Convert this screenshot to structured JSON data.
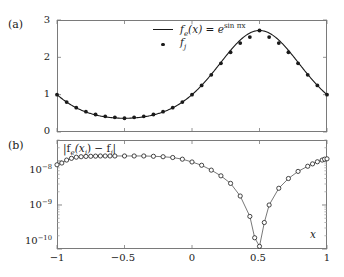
{
  "figure": {
    "panel_a_tag": "(a)",
    "panel_b_tag": "(b)",
    "x_axis_name": "x"
  },
  "legend": {
    "line_entry": {
      "prefix": "f",
      "sub": "e",
      "arg": "(x) = e",
      "exponent": "sin πx"
    },
    "dot_entry": {
      "prefix": "f",
      "sub": "j"
    }
  },
  "panel_b_title": {
    "open": "|f",
    "sub1": "e",
    "mid": "(x",
    "sub2": "j",
    "mid2": ") − f",
    "sub3": "j",
    "close": "|"
  },
  "axis": {
    "a_yticks": [
      "0",
      "1",
      "2",
      "3"
    ],
    "b_yticks": [
      "10",
      "10",
      "10"
    ],
    "b_yexps": [
      "−8",
      "−9",
      "−10"
    ],
    "xticks": [
      "−1",
      "−0.5",
      "0",
      "0.5",
      "1"
    ]
  },
  "chart_data": [
    {
      "type": "line",
      "panel": "(a)",
      "title": "",
      "xlabel": "x",
      "ylabel": "",
      "xlim": [
        -1,
        1
      ],
      "ylim": [
        0,
        3
      ],
      "yscale": "linear",
      "grid": false,
      "legend_position": "upper-center",
      "xticks": [
        -1,
        -0.5,
        0,
        0.5,
        1
      ],
      "yticks": [
        0,
        1,
        2,
        3
      ],
      "series": [
        {
          "name": "f_e(x) = e^{sin pi x}",
          "style": "solid-line",
          "color": "#1a1a1a",
          "x": [
            -1,
            -0.9286,
            -0.8571,
            -0.7857,
            -0.7143,
            -0.6429,
            -0.5714,
            -0.5,
            -0.4286,
            -0.3571,
            -0.2857,
            -0.2143,
            -0.1429,
            -0.0714,
            0,
            0.0714,
            0.1429,
            0.2143,
            0.2857,
            0.3571,
            0.4286,
            0.5,
            0.5714,
            0.6429,
            0.7143,
            0.7857,
            0.8571,
            0.9286,
            1
          ],
          "y": [
            1.0,
            0.8021,
            0.6527,
            0.5438,
            0.4683,
            0.4199,
            0.3936,
            0.3679,
            0.3936,
            0.4199,
            0.4683,
            0.5438,
            0.6527,
            0.8021,
            1.0,
            1.2467,
            1.5321,
            1.8389,
            2.1357,
            2.3811,
            2.5415,
            2.7183,
            2.5415,
            2.3811,
            2.1357,
            1.8389,
            1.5321,
            1.2467,
            1.0
          ]
        },
        {
          "name": "f_j",
          "style": "filled-dots",
          "color": "#1a1a1a",
          "x": [
            -1,
            -0.9286,
            -0.8571,
            -0.7857,
            -0.7143,
            -0.6429,
            -0.5714,
            -0.5,
            -0.4286,
            -0.3571,
            -0.2857,
            -0.2143,
            -0.1429,
            -0.0714,
            0,
            0.0714,
            0.1429,
            0.2143,
            0.2857,
            0.3571,
            0.4286,
            0.5,
            0.5714,
            0.6429,
            0.7143,
            0.7857,
            0.8571,
            0.9286,
            1
          ],
          "y": [
            1.0,
            0.8021,
            0.6527,
            0.5438,
            0.4683,
            0.4199,
            0.3936,
            0.3679,
            0.3936,
            0.4199,
            0.4683,
            0.5438,
            0.6527,
            0.8021,
            1.0,
            1.2467,
            1.5321,
            1.8389,
            2.1357,
            2.3811,
            2.5415,
            2.7183,
            2.5415,
            2.3811,
            2.1357,
            1.8389,
            1.5321,
            1.2467,
            1.0
          ]
        }
      ]
    },
    {
      "type": "line",
      "panel": "(b)",
      "title": "|f_e(x_j) - f_j|",
      "xlabel": "x",
      "ylabel": "",
      "xlim": [
        -1,
        1
      ],
      "ylim": [
        1e-10,
        3e-08
      ],
      "yscale": "log",
      "grid": false,
      "legend_position": "none",
      "xticks": [
        -1,
        -0.5,
        0,
        0.5,
        1
      ],
      "yticks": [
        1e-10,
        1e-09,
        1e-08
      ],
      "series": [
        {
          "name": "absolute error",
          "style": "open-circles-line",
          "color": "#1a1a1a",
          "x": [
            -1,
            -0.9643,
            -0.9286,
            -0.8929,
            -0.8571,
            -0.8214,
            -0.7857,
            -0.75,
            -0.7143,
            -0.6786,
            -0.6429,
            -0.6071,
            -0.5714,
            -0.5,
            -0.4286,
            -0.3571,
            -0.2857,
            -0.2143,
            -0.1429,
            -0.0714,
            0,
            0.0714,
            0.1429,
            0.2143,
            0.2857,
            0.3571,
            0.4286,
            0.4643,
            0.5,
            0.5357,
            0.5714,
            0.6429,
            0.7143,
            0.7857,
            0.8571,
            0.8929,
            0.9286,
            0.9643,
            0.9821,
            1
          ],
          "y": [
            8.2e-09,
            9e-09,
            1.05e-08,
            1.15e-08,
            1.22e-08,
            1.25e-08,
            1.27e-08,
            1.28e-08,
            1.29e-08,
            1.3e-08,
            1.3e-08,
            1.3e-08,
            1.3e-08,
            1.3e-08,
            1.3e-08,
            1.3e-08,
            1.28e-08,
            1.25e-08,
            1.2e-08,
            1.1e-08,
            9.5e-09,
            8e-09,
            6.2e-09,
            4.6e-09,
            3.1e-09,
            1.6e-09,
            5.5e-10,
            1.8e-10,
            1.15e-10,
            4e-10,
            1e-09,
            2.4e-09,
            4e-09,
            5.8e-09,
            7.6e-09,
            8.6e-09,
            9.6e-09,
            1.05e-08,
            1.1e-08,
            1.12e-08
          ]
        }
      ]
    }
  ]
}
